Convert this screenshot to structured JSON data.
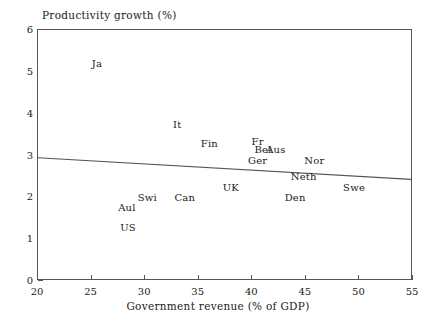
{
  "chart_data": {
    "type": "scatter",
    "title": "",
    "xlabel": "Government revenue (% of GDP)",
    "ylabel": "Productivity growth (%)",
    "xlim": [
      20,
      55
    ],
    "ylim": [
      0,
      6
    ],
    "xticks": [
      20,
      25,
      30,
      35,
      40,
      45,
      50,
      55
    ],
    "yticks": [
      0,
      1,
      2,
      3,
      4,
      5,
      6
    ],
    "grid": false,
    "legend": null,
    "point_label_style": "text-only",
    "points": [
      {
        "label": "Ja",
        "x": 25.5,
        "y": 5.2
      },
      {
        "label": "It",
        "x": 33.0,
        "y": 3.75
      },
      {
        "label": "Fin",
        "x": 36.0,
        "y": 3.3
      },
      {
        "label": "Fr",
        "x": 40.5,
        "y": 3.35
      },
      {
        "label": "Bel",
        "x": 41.0,
        "y": 3.15
      },
      {
        "label": "Aus",
        "x": 42.2,
        "y": 3.15
      },
      {
        "label": "Ger",
        "x": 40.5,
        "y": 2.9
      },
      {
        "label": "Nor",
        "x": 45.8,
        "y": 2.9
      },
      {
        "label": "Neth",
        "x": 44.8,
        "y": 2.5
      },
      {
        "label": "Swe",
        "x": 49.5,
        "y": 2.25
      },
      {
        "label": "UK",
        "x": 38.0,
        "y": 2.25
      },
      {
        "label": "Can",
        "x": 33.7,
        "y": 2.0
      },
      {
        "label": "Swi",
        "x": 30.2,
        "y": 2.0
      },
      {
        "label": "Den",
        "x": 44.0,
        "y": 2.0
      },
      {
        "label": "Aul",
        "x": 28.3,
        "y": 1.77
      },
      {
        "label": "US",
        "x": 28.4,
        "y": 1.3
      }
    ],
    "fit_line": {
      "type": "linear-regression",
      "x_start": 20,
      "y_start": 2.92,
      "x_end": 55,
      "y_end": 2.4,
      "color": "#555555"
    },
    "axis_color": "#555555",
    "text_color": "#1a1a1a",
    "background": "#ffffff"
  }
}
